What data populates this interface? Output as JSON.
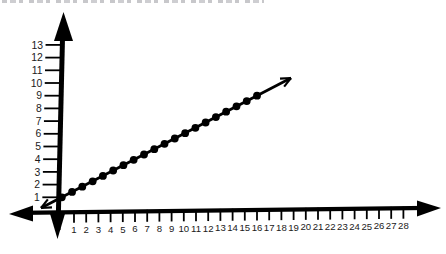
{
  "colors": {
    "background": "#ffffff",
    "axis": "#000000",
    "line": "#000000",
    "dot": "#000000",
    "text": "#1a1a1a"
  },
  "chart_data": {
    "type": "line",
    "title": "",
    "xlabel": "",
    "ylabel": "",
    "grid": false,
    "legend": false,
    "x_range": [
      0,
      28.5
    ],
    "y_range": [
      0,
      13.5
    ],
    "x_tick_labels": [
      "1",
      "2",
      "3",
      "4",
      "5",
      "6",
      "7",
      "8",
      "9",
      "10",
      "11",
      "12",
      "13",
      "14",
      "15",
      "16",
      "17",
      "18",
      "19",
      "20",
      "21",
      "22",
      "23",
      "24",
      "25",
      "26",
      "27",
      "28"
    ],
    "y_tick_labels": [
      "1",
      "2",
      "3",
      "4",
      "5",
      "6",
      "7",
      "8",
      "9",
      "10",
      "11",
      "12",
      "13"
    ],
    "line": {
      "equation": "y = 0.5x + 1",
      "slope": 0.5,
      "y_intercept": 1,
      "arrow_at_start": true,
      "arrow_at_end": true
    },
    "points": [
      {
        "x": 0.0,
        "y": 1.0
      },
      {
        "x": 0.84,
        "y": 1.42
      },
      {
        "x": 1.68,
        "y": 1.84
      },
      {
        "x": 2.53,
        "y": 2.26
      },
      {
        "x": 3.37,
        "y": 2.68
      },
      {
        "x": 4.21,
        "y": 3.11
      },
      {
        "x": 5.05,
        "y": 3.53
      },
      {
        "x": 5.89,
        "y": 3.95
      },
      {
        "x": 6.74,
        "y": 4.37
      },
      {
        "x": 7.58,
        "y": 4.79
      },
      {
        "x": 8.42,
        "y": 5.21
      },
      {
        "x": 9.26,
        "y": 5.63
      },
      {
        "x": 10.11,
        "y": 6.05
      },
      {
        "x": 10.95,
        "y": 6.47
      },
      {
        "x": 11.79,
        "y": 6.89
      },
      {
        "x": 12.63,
        "y": 7.32
      },
      {
        "x": 13.47,
        "y": 7.74
      },
      {
        "x": 14.32,
        "y": 8.16
      },
      {
        "x": 15.16,
        "y": 8.58
      },
      {
        "x": 16.0,
        "y": 9.0
      }
    ]
  }
}
